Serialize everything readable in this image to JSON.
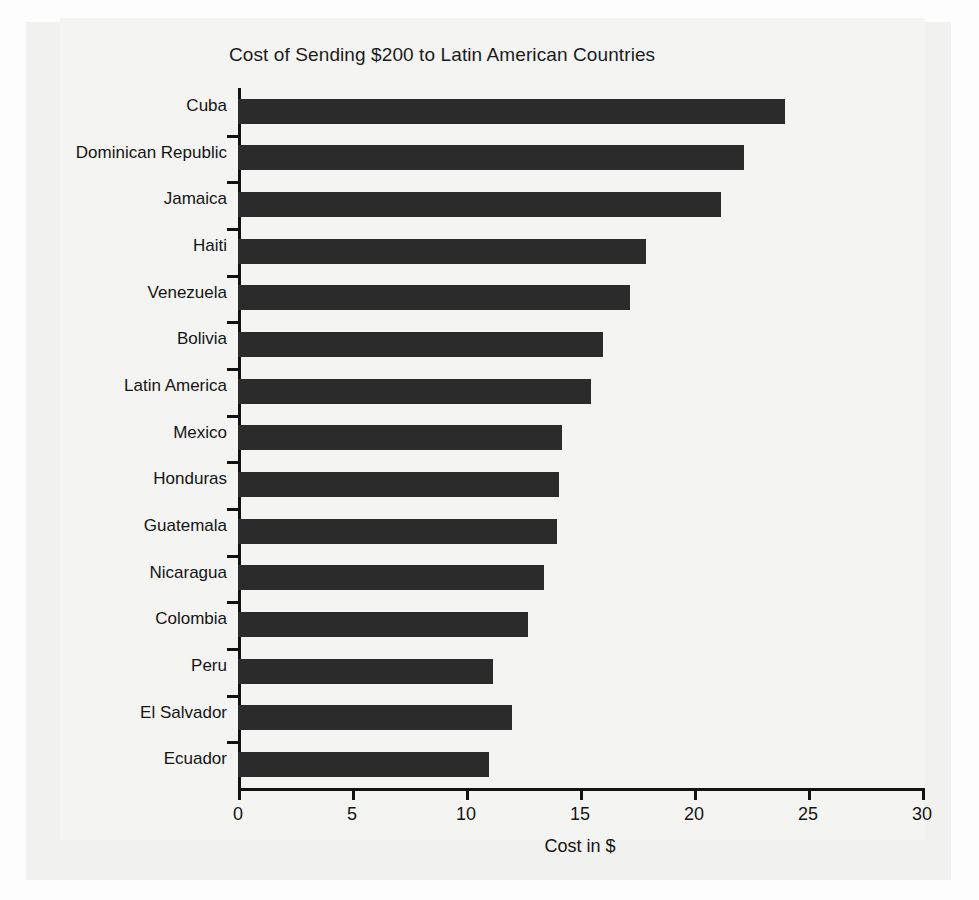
{
  "chart_data": {
    "type": "bar",
    "orientation": "horizontal",
    "title": "Cost of Sending $200 to Latin American Countries",
    "xlabel": "Cost in $",
    "ylabel": "",
    "xlim": [
      0,
      30
    ],
    "xticks": [
      0,
      5,
      10,
      15,
      20,
      25,
      30
    ],
    "xtick_labels": [
      "0",
      "5",
      "10",
      "15",
      "20",
      "25",
      "30"
    ],
    "grid": false,
    "legend": false,
    "bar_color": "#2b2b2b",
    "background_color": "#f4f4f2",
    "categories": [
      "Cuba",
      "Dominican Republic",
      "Jamaica",
      "Haiti",
      "Venezuela",
      "Bolivia",
      "Latin America",
      "Mexico",
      "Honduras",
      "Guatemala",
      "Nicaragua",
      "Colombia",
      "Peru",
      "El Salvador",
      "Ecuador"
    ],
    "values": [
      24.0,
      22.2,
      21.2,
      17.9,
      17.2,
      16.0,
      15.5,
      14.2,
      14.1,
      14.0,
      13.4,
      12.7,
      11.2,
      12.0,
      11.0
    ]
  }
}
